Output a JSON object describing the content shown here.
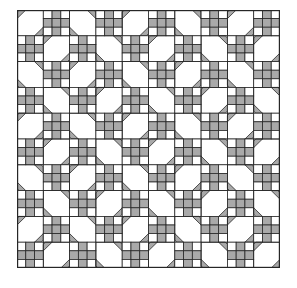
{
  "figure": {
    "type": "quilt-pattern",
    "grid": {
      "rows": 10,
      "cols": 10
    },
    "colors": {
      "fill": "#a9a9a9",
      "background": "#ffffff",
      "line": "#262626"
    },
    "checker_block": {
      "subgrid": 3,
      "gray_cells": [
        [
          0,
          1
        ],
        [
          1,
          0
        ],
        [
          1,
          1
        ],
        [
          1,
          2
        ],
        [
          2,
          1
        ]
      ]
    },
    "diagonal_block": {
      "rule": "placed where (row+col) is even; direction '/' when floor(row/2)+floor(col/2) is even, otherwise '\\'"
    }
  }
}
